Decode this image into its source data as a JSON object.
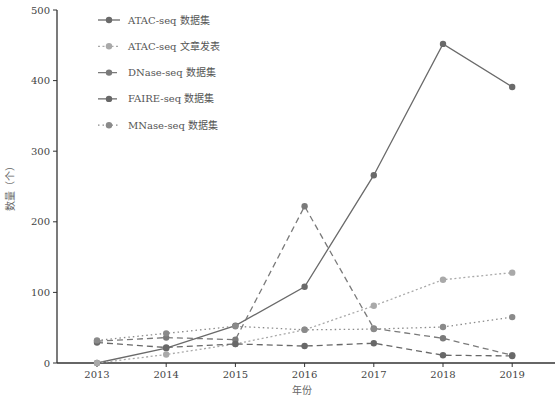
{
  "chart_data": {
    "type": "line",
    "title": "",
    "xlabel": "年份",
    "ylabel": "数量（个）",
    "x": [
      "2013",
      "2014",
      "2015",
      "2016",
      "2017",
      "2018",
      "2019"
    ],
    "ylim": [
      0,
      500
    ],
    "yticks": [
      0,
      100,
      200,
      300,
      400,
      500
    ],
    "grid": false,
    "legend_position": "top-left",
    "series": [
      {
        "name": "ATAC-seq 数据集",
        "style": "solid",
        "color": "#6a6a6a",
        "values": [
          0,
          21,
          53,
          108,
          266,
          452,
          391
        ]
      },
      {
        "name": "ATAC-seq 文章发表",
        "style": "dotted-fine",
        "color": "#a9a9a9",
        "values": [
          0,
          12,
          27,
          47,
          81,
          118,
          128
        ]
      },
      {
        "name": "DNase-seq 数据集",
        "style": "dashed",
        "color": "#7a7a7a",
        "values": [
          31,
          36,
          33,
          222,
          49,
          35,
          11
        ]
      },
      {
        "name": "FAIRE-seq 数据集",
        "style": "dashed",
        "color": "#686868",
        "values": [
          29,
          22,
          27,
          24,
          28,
          11,
          10
        ]
      },
      {
        "name": "MNase-seq 数据集",
        "style": "dotted",
        "color": "#8a8a8a",
        "values": [
          32,
          42,
          52,
          47,
          48,
          51,
          65
        ]
      }
    ]
  }
}
